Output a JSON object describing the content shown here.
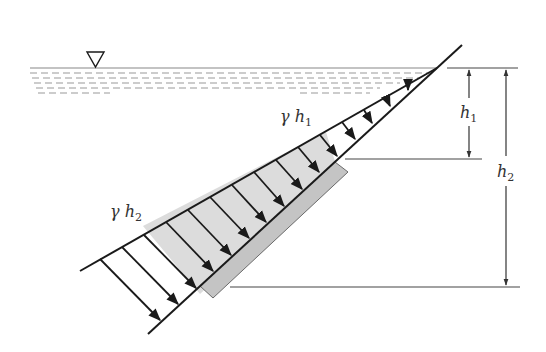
{
  "diagram": {
    "labels": {
      "gamma_h1": {
        "symbol": "γ h",
        "subscript": "1"
      },
      "gamma_h2": {
        "symbol": "γ h",
        "subscript": "2"
      },
      "h1": {
        "symbol": "h",
        "subscript": "1"
      },
      "h2": {
        "symbol": "h",
        "subscript": "2"
      }
    },
    "elements": {
      "free_surface_symbol": "▽",
      "water_surface": "free water surface (dashed hatching)",
      "inclined_wall": "inclined plane surface",
      "gate": "submerged rectangular gate (shaded)",
      "pressure_prism": "triangular pressure distribution with arrows normal to wall"
    },
    "colors": {
      "line": "#1a1a1a",
      "gate_fill": "#c8c8c8",
      "pressure_fill": "#dcdcdc",
      "water_dash": "#9a9a9a",
      "dimension_line": "#444444"
    }
  }
}
